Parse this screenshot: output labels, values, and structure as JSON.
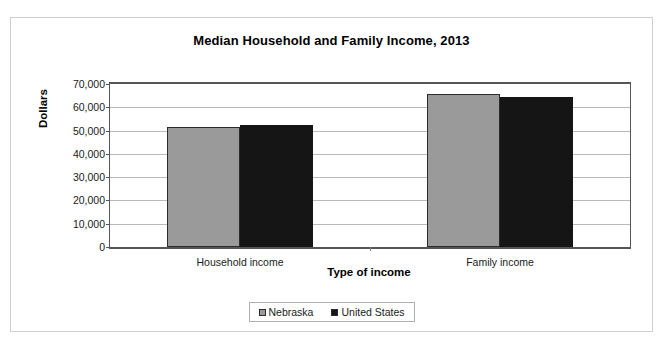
{
  "chart_data": {
    "type": "bar",
    "title": "Median Household and Family Income, 2013",
    "xlabel": "Type of income",
    "ylabel": "Dollars",
    "categories": [
      "Household income",
      "Family income"
    ],
    "series": [
      {
        "name": "Nebraska",
        "color": "#9a9a9a",
        "values": [
          51700,
          65500
        ]
      },
      {
        "name": "United States",
        "color": "#151515",
        "values": [
          52300,
          64300
        ]
      }
    ],
    "ylim": [
      0,
      70000
    ],
    "ytick_values": [
      0,
      10000,
      20000,
      30000,
      40000,
      50000,
      60000,
      70000
    ],
    "ytick_labels": [
      "0",
      "10,000",
      "20,000",
      "30,000",
      "40,000",
      "50,000",
      "60,000",
      "70,000"
    ],
    "grid": true,
    "legend_position": "bottom"
  }
}
